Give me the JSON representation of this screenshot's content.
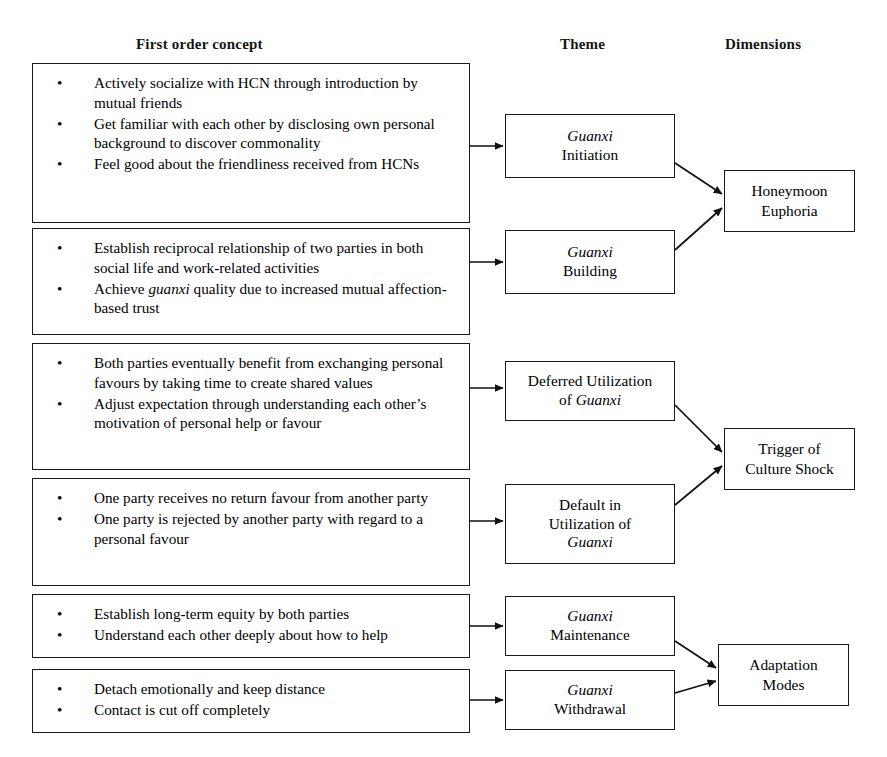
{
  "headers": {
    "first_order": "First order concept",
    "theme": "Theme",
    "dimensions": "Dimensions"
  },
  "bullet_glyph": "•",
  "colors": {
    "stroke": "#1a1a1a",
    "text": "#000000",
    "background": "#ffffff"
  },
  "concepts": [
    {
      "id": "concept-guanxi-initiation",
      "bullets": [
        "Actively socialize with HCN through introduction by mutual friends",
        "Get familiar with each other by disclosing own personal background to discover commonality",
        "Feel good about the friendliness received from HCNs"
      ]
    },
    {
      "id": "concept-guanxi-building",
      "bullets": [
        "Establish reciprocal relationship of two parties in both social life and work-related activities",
        "Achieve |guanxi| quality due to increased mutual affection-based trust"
      ]
    },
    {
      "id": "concept-deferred-utilization",
      "bullets": [
        "Both parties eventually benefit from exchanging personal favours by taking time to create shared values",
        "Adjust expectation through understanding each other’s motivation of personal help or favour"
      ]
    },
    {
      "id": "concept-default-utilization",
      "bullets": [
        "One party receives no return favour from another party",
        "One party is rejected by another party with regard to a personal favour"
      ]
    },
    {
      "id": "concept-guanxi-maintenance",
      "bullets": [
        "Establish long-term equity by both parties",
        "Understand each other deeply about how to help"
      ]
    },
    {
      "id": "concept-guanxi-withdrawal",
      "bullets": [
        "Detach emotionally and keep distance",
        "Contact is cut off completely"
      ]
    }
  ],
  "themes": [
    {
      "id": "theme-guanxi-initiation",
      "line1": "Guanxi",
      "line1_italic": true,
      "line2": "Initiation",
      "line2_italic": false,
      "line3": "",
      "line3_italic": false
    },
    {
      "id": "theme-guanxi-building",
      "line1": "Guanxi",
      "line1_italic": true,
      "line2": "Building",
      "line2_italic": false,
      "line3": "",
      "line3_italic": false
    },
    {
      "id": "theme-deferred-utilization",
      "line1": "Deferred Utilization",
      "line1_italic": false,
      "line2": "of Guanxi",
      "line2_italic": false,
      "line2_html": "of <i>Guanxi</i>",
      "line3": "",
      "line3_italic": false
    },
    {
      "id": "theme-default-utilization",
      "line1": "Default in",
      "line1_italic": false,
      "line2": "Utilization of",
      "line2_italic": false,
      "line3": "Guanxi",
      "line3_italic": true
    },
    {
      "id": "theme-guanxi-maintenance",
      "line1": "Guanxi",
      "line1_italic": true,
      "line2": "Maintenance",
      "line2_italic": false,
      "line3": "",
      "line3_italic": false
    },
    {
      "id": "theme-guanxi-withdrawal",
      "line1": "Guanxi",
      "line1_italic": true,
      "line2": "Withdrawal",
      "line2_italic": false,
      "line3": "",
      "line3_italic": false
    }
  ],
  "dimensions": [
    {
      "id": "dimension-honeymoon-euphoria",
      "line1": "Honeymoon",
      "line2": "Euphoria"
    },
    {
      "id": "dimension-trigger-culture-shock",
      "line1": "Trigger of",
      "line2": "Culture Shock"
    },
    {
      "id": "dimension-adaptation-modes",
      "line1": "Adaptation",
      "line2": "Modes"
    }
  ]
}
